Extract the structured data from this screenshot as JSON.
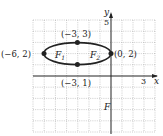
{
  "diagram": {
    "type": "ellipse-graph",
    "axes": {
      "x_label": "x",
      "y_label": "y",
      "x_tick_label": "3",
      "y_tick_label": "5",
      "x_range": [
        -7,
        4
      ],
      "y_range": [
        -5,
        5
      ]
    },
    "ellipse": {
      "center": [
        -3,
        2
      ],
      "rx": 3,
      "ry": 1
    },
    "points": [
      {
        "label": "(−6, 2)",
        "x": -6,
        "y": 2
      },
      {
        "label": "(−3, 3)",
        "x": -3,
        "y": 3
      },
      {
        "label": "(0, 2)",
        "x": 0,
        "y": 2
      },
      {
        "label": "(−3, 1)",
        "x": -3,
        "y": 1
      }
    ],
    "foci": [
      {
        "label": "F",
        "sub": "1"
      },
      {
        "label": "F",
        "sub": "2"
      }
    ],
    "extra_label": "F"
  }
}
